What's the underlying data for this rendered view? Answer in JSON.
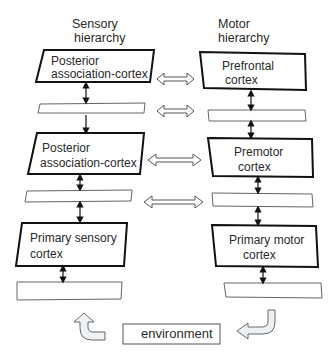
{
  "headers": {
    "sensory_line1": "Sensory",
    "sensory_line2": "hierarchy",
    "motor_line1": "Motor",
    "motor_line2": "hierarchy"
  },
  "sensory_boxes": [
    {
      "line1": "Posterior",
      "line2": "association-cortex"
    },
    {
      "line1": "Posterior",
      "line2": "association-cortex"
    },
    {
      "line1": "Primary sensory",
      "line2": "cortex"
    }
  ],
  "motor_boxes": [
    {
      "line1": "Prefrontal",
      "line2": "cortex"
    },
    {
      "line1": "Premotor",
      "line2": "cortex"
    },
    {
      "line1": "Primary motor",
      "line2": "cortex"
    }
  ],
  "environment": {
    "label": "environment"
  },
  "colors": {
    "stroke": "#111111",
    "thin_stroke": "#555555",
    "arrow_fill": "#f2f4f6",
    "arrow_stroke": "#666666"
  }
}
